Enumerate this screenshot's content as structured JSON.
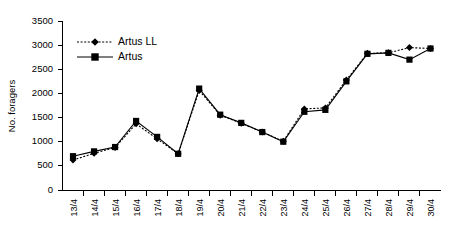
{
  "chart_data": {
    "type": "line",
    "title": "",
    "xlabel": "",
    "ylabel": "No. foragers",
    "ylim": [
      0,
      3500
    ],
    "yticks": [
      0,
      500,
      1000,
      1500,
      2000,
      2500,
      3000,
      3500
    ],
    "ytick_labels": [
      "0",
      "500",
      "1000",
      "1500",
      "2000",
      "2500",
      "3000",
      "3500"
    ],
    "grid": false,
    "legend_position": "top-left",
    "categories": [
      "13/4",
      "14/4",
      "15/4",
      "16/4",
      "17/4",
      "18/4",
      "19/4",
      "20/4",
      "21/4",
      "22/4",
      "23/4",
      "24/4",
      "25/4",
      "26/4",
      "27/4",
      "28/4",
      "29/4",
      "30/4"
    ],
    "series": [
      {
        "name": "Artus LL",
        "line_style": "dotted",
        "marker": "diamond",
        "color": "#000000",
        "values": [
          620,
          760,
          880,
          1370,
          1060,
          750,
          2060,
          1550,
          1380,
          1200,
          1010,
          1680,
          1700,
          2280,
          2830,
          2840,
          2950,
          2930
        ]
      },
      {
        "name": "Artus",
        "line_style": "solid",
        "marker": "square",
        "color": "#000000",
        "values": [
          700,
          800,
          890,
          1430,
          1100,
          750,
          2100,
          1560,
          1390,
          1200,
          1000,
          1620,
          1660,
          2250,
          2820,
          2840,
          2700,
          2930
        ]
      }
    ]
  },
  "legend": {
    "entries": [
      {
        "label": "Artus LL"
      },
      {
        "label": "Artus"
      }
    ]
  }
}
